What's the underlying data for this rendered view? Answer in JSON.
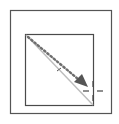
{
  "icon": {
    "name": "diagonal-line-drag-tool",
    "colors": {
      "background": "#ffffff",
      "frame": "#555555",
      "inner_frame": "#4a4a4a",
      "diagonal_line": "#bdbdbd",
      "dotted_path": "#6e6e6e",
      "arrowhead": "#555555",
      "crosshair": "#444444"
    }
  }
}
